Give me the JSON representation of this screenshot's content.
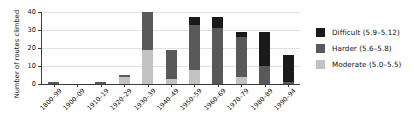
{
  "chart_data": {
    "type": "bar",
    "title": "",
    "subtitle": "",
    "xlabel": "",
    "ylabel": "Number of routes climbed",
    "ylim": [
      0,
      40
    ],
    "yticks": [
      0,
      10,
      20,
      30,
      40
    ],
    "grid": true,
    "stacked": true,
    "legend_position": "right",
    "categories": [
      "1800–99",
      "1900–09",
      "1910–19",
      "1920–29",
      "1930–39",
      "1940–49",
      "1950–59",
      "1960–69",
      "1970–79",
      "1980–89",
      "1990–94"
    ],
    "series": [
      {
        "name": "Moderate (5.0–5.5)",
        "color": "#c2c2c2",
        "values": [
          0,
          0,
          0,
          4,
          19,
          3,
          8,
          0,
          4,
          0,
          0
        ]
      },
      {
        "name": "Harder (5.6–5.8)",
        "color": "#595959",
        "values": [
          1,
          0,
          1,
          1,
          21,
          16,
          25,
          31,
          22,
          10,
          1
        ]
      },
      {
        "name": "Difficult (5.9–5.12)",
        "color": "#1a1a1a",
        "values": [
          0,
          0,
          0,
          0,
          0,
          0,
          4,
          6,
          3,
          19,
          15
        ]
      }
    ],
    "totals": [
      1,
      0,
      1,
      5,
      40,
      19,
      37,
      37,
      29,
      29,
      16
    ]
  },
  "legend": {
    "items": [
      {
        "label": "Difficult (5.9–5.12)",
        "color": "#1a1a1a"
      },
      {
        "label": "Harder (5.6–5.8)",
        "color": "#595959"
      },
      {
        "label": "Moderate (5.0–5.5)",
        "color": "#c2c2c2"
      }
    ]
  }
}
